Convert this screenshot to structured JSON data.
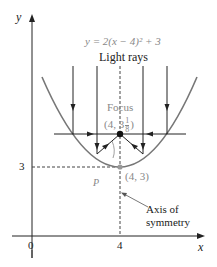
{
  "diagram": {
    "equation": "y = 2(x − 4)² + 3",
    "light_rays_label": "Light rays",
    "focus_label": "Focus",
    "focus_coords": "(4, 3",
    "focus_whole": "3",
    "focus_frac_num": "1",
    "focus_frac_den": "8",
    "focus_close": ")",
    "vertex_label": "(4, 3)",
    "axis_of_symmetry_line1": "Axis of",
    "axis_of_symmetry_line2": "symmetry",
    "angle_label_p": "P",
    "y_axis_label": "y",
    "x_axis_label": "x",
    "x_ticks": [
      "0",
      "4"
    ],
    "y_ticks": [
      "3"
    ],
    "colors": {
      "parabola": "#777777",
      "axes": "#222222",
      "rays": "#222222",
      "text_gray": "#888888"
    }
  }
}
